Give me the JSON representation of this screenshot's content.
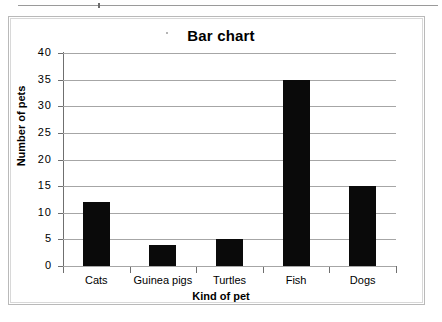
{
  "chart_data": {
    "type": "bar",
    "title": "Bar chart",
    "xlabel": "Kind of pet",
    "ylabel": "Number of pets",
    "categories": [
      "Cats",
      "Guinea pigs",
      "Turtles",
      "Fish",
      "Dogs"
    ],
    "values": [
      12,
      4,
      5,
      35,
      15
    ],
    "ylim": [
      0,
      40
    ],
    "yticks": [
      0,
      5,
      10,
      15,
      20,
      25,
      30,
      35,
      40
    ],
    "ytick_labels": [
      "0",
      "5",
      "10",
      "15",
      "20",
      "25",
      "30",
      "35",
      "40"
    ],
    "grid": true,
    "legend": null,
    "bar_color": "#0a0a0a",
    "gridline_color": "#a6a6a6",
    "axis_color": "#6f6f6f",
    "background_color": "#ffffff"
  }
}
